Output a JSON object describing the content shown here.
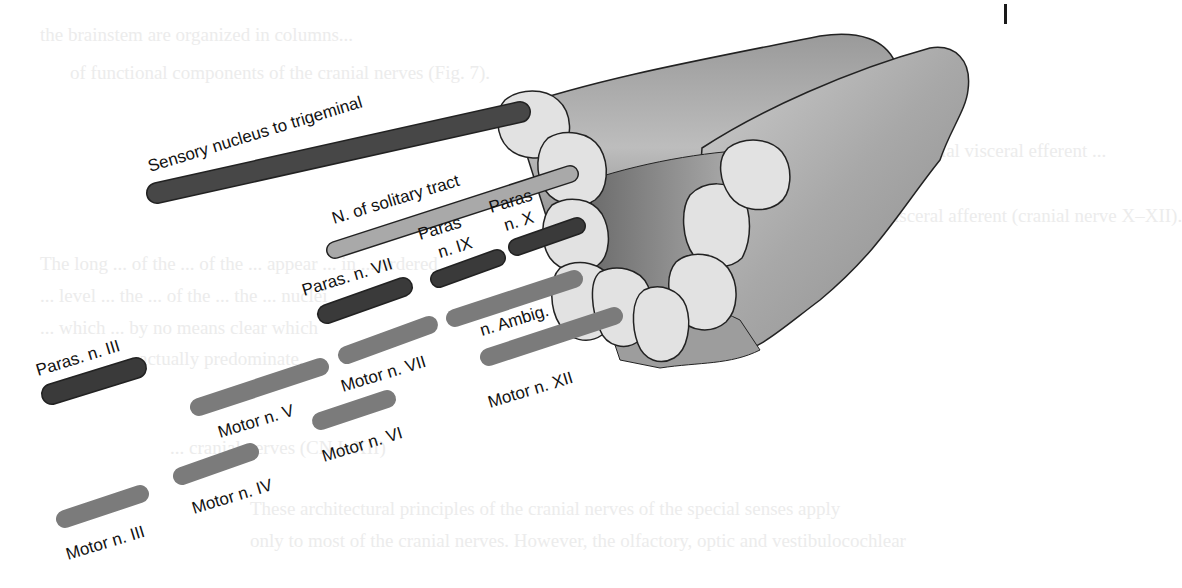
{
  "figure": {
    "colors": {
      "parasympathetic": "#3a3a3a",
      "sensory": "#474747",
      "solitary": "#a9a9a9",
      "motor": "#7b7b7b",
      "bundle_dark": "#8a8a8a",
      "bundle_light": "#d8d8d8",
      "bundle_face": "#e4e4e4",
      "outline": "#222222"
    },
    "labels": {
      "sensory_trigeminal": "Sensory nucleus to trigeminal",
      "solitary_tract": "N. of solitary tract",
      "paras_ix_line1": "Paras",
      "paras_ix_line2": "n. IX",
      "paras_x_line1": "Paras",
      "paras_x_line2": "n. X",
      "paras_vii": "Paras. n. VII",
      "paras_iii": "Paras. n. III",
      "n_ambig": "n. Ambig.",
      "motor_vii": "Motor n. VII",
      "motor_v": "Motor n. V",
      "motor_vi": "Motor n. VI",
      "motor_xii": "Motor n. XII",
      "motor_iv": "Motor n. IV",
      "motor_iii": "Motor n. III"
    }
  },
  "background_text": {
    "lines": [
      "the brainstem are organized in columns...",
      "of functional components of the cranial nerves (Fig. 7).",
      "the ... general somatic efferent and special visceral efferent ...",
      "the ... columns ...",
      "... the somatic afferent ... and ... visceral afferent (cranial nerve X–XII).",
      "The long ... of the ... of the ... appear ... in ... ordered",
      "... level ... the ... of the ... the ... nuclei",
      "... which ... by no means clear which",
      "... actually predominate.",
      "... cranial nerves (CN I–XII)",
      "These architectural principles of the cranial nerves of the special senses apply",
      "only to most of the cranial nerves. However, the olfactory, optic and vestibulocochlear"
    ]
  }
}
